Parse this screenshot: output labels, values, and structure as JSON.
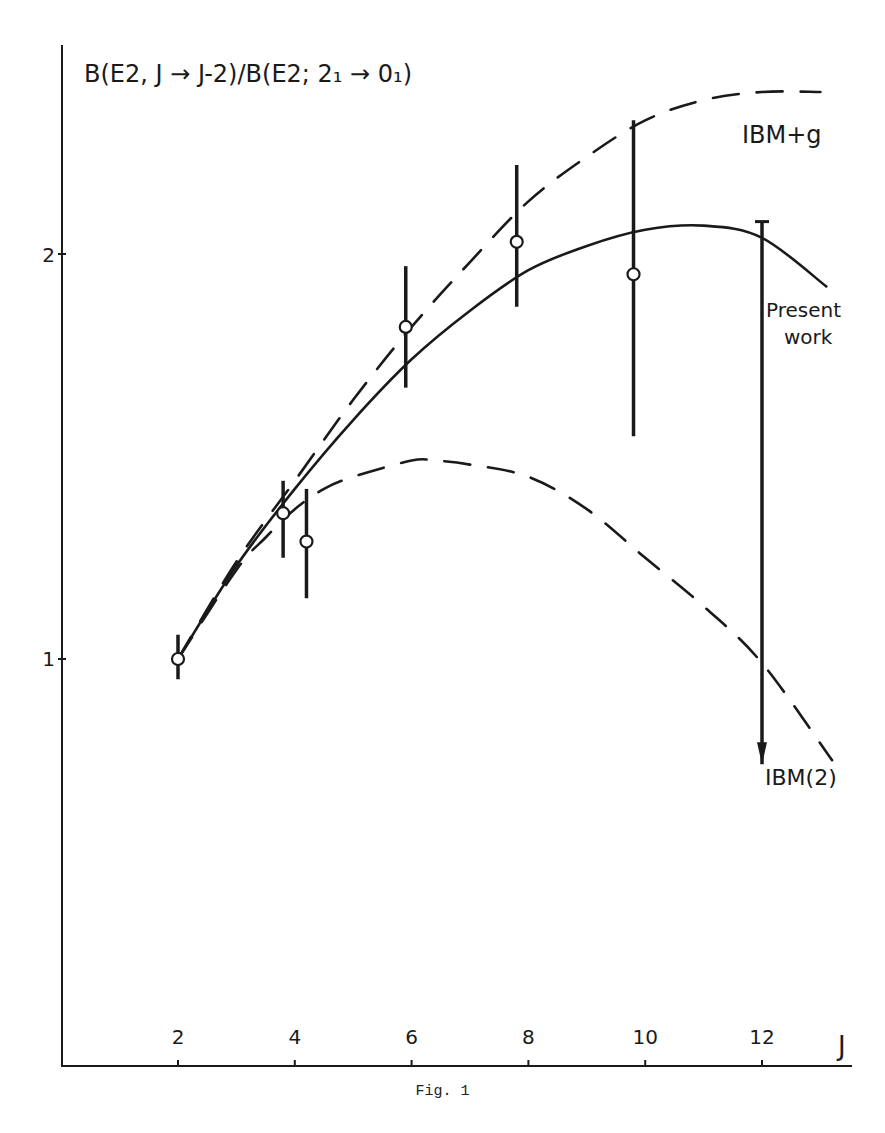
{
  "chart_data": {
    "type": "line",
    "title": "B(E2, J → J-2)/B(E2; 2₁ → 0₁)",
    "xlabel": "J",
    "ylabel": "B(E2, J → J-2)/B(E2; 2₁ → 0₁)",
    "caption": "Fig. 1",
    "xlim": [
      0,
      13.5
    ],
    "ylim": [
      0,
      2.5
    ],
    "x_ticks": [
      2,
      4,
      6,
      8,
      10,
      12
    ],
    "y_ticks": [
      1,
      2
    ],
    "grid": false,
    "legend_position": "inline labels at right",
    "series": [
      {
        "name": "IBM+g",
        "style": "dashed",
        "x": [
          2,
          3,
          4,
          5,
          6,
          7,
          8,
          9,
          10,
          11,
          12,
          13
        ],
        "values": [
          1.0,
          1.24,
          1.44,
          1.64,
          1.82,
          1.98,
          2.13,
          2.24,
          2.33,
          2.38,
          2.4,
          2.4
        ]
      },
      {
        "name": "Present work",
        "style": "solid",
        "x": [
          2,
          3,
          4,
          5,
          6,
          7,
          8,
          9,
          10,
          11,
          12,
          13.1
        ],
        "values": [
          1.0,
          1.23,
          1.42,
          1.59,
          1.74,
          1.86,
          1.96,
          2.02,
          2.06,
          2.07,
          2.04,
          1.92
        ]
      },
      {
        "name": "IBM(2)",
        "style": "dashed",
        "x": [
          2,
          3,
          3.5,
          4,
          4.5,
          5,
          6,
          6.4,
          7,
          8,
          9,
          10,
          11,
          12,
          13.2
        ],
        "values": [
          1.0,
          1.22,
          1.3,
          1.37,
          1.42,
          1.45,
          1.49,
          1.49,
          1.48,
          1.45,
          1.37,
          1.25,
          1.13,
          0.99,
          0.75
        ]
      },
      {
        "name": "Experiment",
        "style": "points with error bars",
        "points": [
          {
            "x": 2,
            "y": 1.0,
            "err_low": 0.95,
            "err_high": 1.06
          },
          {
            "x": 3.8,
            "y": 1.36,
            "err_low": 1.25,
            "err_high": 1.44
          },
          {
            "x": 4.2,
            "y": 1.29,
            "err_low": 1.15,
            "err_high": 1.42
          },
          {
            "x": 5.9,
            "y": 1.82,
            "err_low": 1.67,
            "err_high": 1.97
          },
          {
            "x": 7.8,
            "y": 2.03,
            "err_low": 1.87,
            "err_high": 2.22
          },
          {
            "x": 9.8,
            "y": 1.95,
            "err_low": 1.55,
            "err_high": 2.33
          },
          {
            "x": 12,
            "y": null,
            "err_low": 0.74,
            "err_high": 2.08,
            "note": "upper limit, downward arrow"
          }
        ]
      }
    ],
    "annotations": [
      {
        "text": "IBM+g",
        "near": "upper right dashed curve"
      },
      {
        "text": "Present",
        "near": "solid curve end"
      },
      {
        "text": "work",
        "near": "solid curve end"
      },
      {
        "text": "IBM(2)",
        "near": "lower dashed curve end"
      }
    ]
  },
  "labels": {
    "title": "B(E2, J → J-2)/B(E2; 2₁ → 0₁)",
    "x_axis": "J",
    "y_tick_1": "1",
    "y_tick_2": "2",
    "x_ticks": [
      "2",
      "4",
      "6",
      "8",
      "10",
      "12"
    ],
    "ibm_g": "IBM+g",
    "present_1": "Present",
    "present_2": "work",
    "ibm2": "IBM(2)",
    "caption": "Fig. 1"
  }
}
